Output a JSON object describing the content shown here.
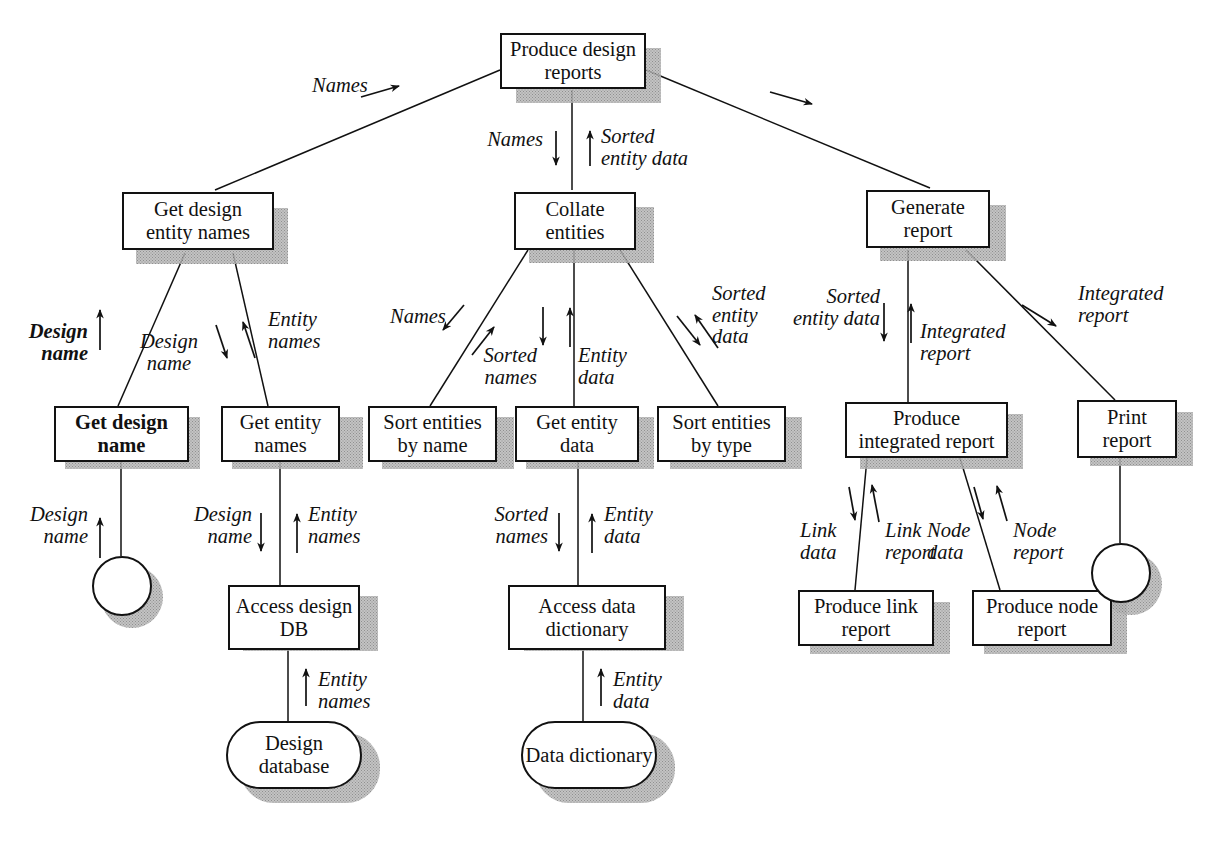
{
  "diagram": {
    "type": "structure-chart",
    "ink_color": "#121212",
    "background_color": "#ffffff",
    "shadow_color": "#b9b9b9"
  },
  "nodes": {
    "root": {
      "label": "Produce\ndesign reports",
      "shape": "box",
      "bold_text": false
    },
    "get_design_names": {
      "label": "Get design\nentity names",
      "shape": "box",
      "bold_text": false
    },
    "collate": {
      "label": "Collate\nentities",
      "shape": "box",
      "bold_text": false
    },
    "generate": {
      "label": "Generate\nreport",
      "shape": "box",
      "bold_text": false
    },
    "get_design_name": {
      "label": "Get design\nname",
      "shape": "box",
      "bold_text": true
    },
    "get_entity_names": {
      "label": "Get entity\nnames",
      "shape": "box",
      "bold_text": false
    },
    "sort_by_name": {
      "label": "Sort entities\nby name",
      "shape": "box",
      "bold_text": false
    },
    "get_entity_data": {
      "label": "Get entity\ndata",
      "shape": "box",
      "bold_text": false
    },
    "sort_by_type": {
      "label": "Sort entities\nby type",
      "shape": "box",
      "bold_text": false
    },
    "produce_integrated": {
      "label": "Produce\nintegrated report",
      "shape": "box",
      "bold_text": false
    },
    "print_report": {
      "label": "Print\nreport",
      "shape": "box",
      "bold_text": false
    },
    "access_design_db": {
      "label": "Access\ndesign DB",
      "shape": "box",
      "bold_text": false
    },
    "access_data_dict": {
      "label": "Access\ndata dictionary",
      "shape": "box",
      "bold_text": false
    },
    "produce_link": {
      "label": "Produce link\nreport",
      "shape": "box",
      "bold_text": false
    },
    "produce_node": {
      "label": "Produce\nnode report",
      "shape": "box",
      "bold_text": false
    },
    "design_database": {
      "label": "Design\ndatabase",
      "shape": "datastore",
      "bold_text": false
    },
    "data_dictionary": {
      "label": "Data\ndictionary",
      "shape": "datastore",
      "bold_text": false
    },
    "terminator_left": {
      "label": "",
      "shape": "circle",
      "bold_text": false
    },
    "terminator_right": {
      "label": "",
      "shape": "circle",
      "bold_text": false
    }
  },
  "flows": [
    {
      "id": "f01",
      "label": "Names",
      "direction": "up",
      "bold": false,
      "from": "get_design_names",
      "to": "root"
    },
    {
      "id": "f02",
      "label": "Names",
      "direction": "down",
      "bold": false,
      "from": "root",
      "to": "collate"
    },
    {
      "id": "f03",
      "label": "Sorted\nentity data",
      "direction": "up",
      "bold": false,
      "from": "collate",
      "to": "root"
    },
    {
      "id": "f04",
      "label": "",
      "direction": "down",
      "bold": false,
      "from": "root",
      "to": "generate"
    },
    {
      "id": "f05",
      "label": "Design\nname",
      "direction": "up",
      "bold": true,
      "from": "get_design_name",
      "to": "get_design_names"
    },
    {
      "id": "f06",
      "label": "Design\nname",
      "direction": "down",
      "bold": false,
      "from": "get_design_names",
      "to": "get_entity_names"
    },
    {
      "id": "f07",
      "label": "Entity\nnames",
      "direction": "up",
      "bold": false,
      "from": "get_entity_names",
      "to": "get_design_names"
    },
    {
      "id": "f08",
      "label": "Names",
      "direction": "down",
      "bold": false,
      "from": "collate",
      "to": "sort_by_name"
    },
    {
      "id": "f09",
      "label": "Sorted\nnames",
      "direction": "up",
      "bold": false,
      "from": "sort_by_name",
      "to": "collate"
    },
    {
      "id": "f10",
      "label": "Entity\ndata",
      "direction": "up",
      "bold": false,
      "from": "get_entity_data",
      "to": "collate"
    },
    {
      "id": "f11",
      "label": "Sorted\nentity\ndata",
      "direction": "both",
      "bold": false,
      "from": "collate",
      "to": "sort_by_type"
    },
    {
      "id": "f12",
      "label": "Sorted\nentity data",
      "direction": "down",
      "bold": false,
      "from": "generate",
      "to": "produce_integrated"
    },
    {
      "id": "f13",
      "label": "Integrated\nreport",
      "direction": "up",
      "bold": false,
      "from": "produce_integrated",
      "to": "generate"
    },
    {
      "id": "f14",
      "label": "Integrated\nreport",
      "direction": "down",
      "bold": false,
      "from": "generate",
      "to": "print_report"
    },
    {
      "id": "f15",
      "label": "Design\nname",
      "direction": "up",
      "bold": false,
      "from": "terminator_left",
      "to": "get_design_name"
    },
    {
      "id": "f16",
      "label": "Design\nname",
      "direction": "down",
      "bold": false,
      "from": "get_entity_names",
      "to": "access_design_db"
    },
    {
      "id": "f17",
      "label": "Entity\nnames",
      "direction": "up",
      "bold": false,
      "from": "access_design_db",
      "to": "get_entity_names"
    },
    {
      "id": "f18",
      "label": "Sorted\nnames",
      "direction": "down",
      "bold": false,
      "from": "get_entity_data",
      "to": "access_data_dict"
    },
    {
      "id": "f19",
      "label": "Entity\ndata",
      "direction": "up",
      "bold": false,
      "from": "access_data_dict",
      "to": "get_entity_data"
    },
    {
      "id": "f20",
      "label": "Link\ndata",
      "direction": "down",
      "bold": false,
      "from": "produce_integrated",
      "to": "produce_link"
    },
    {
      "id": "f21",
      "label": "Link\nreport",
      "direction": "up",
      "bold": false,
      "from": "produce_link",
      "to": "produce_integrated"
    },
    {
      "id": "f22",
      "label": "Node\ndata",
      "direction": "down",
      "bold": false,
      "from": "produce_integrated",
      "to": "produce_node"
    },
    {
      "id": "f23",
      "label": "Node\nreport",
      "direction": "up",
      "bold": false,
      "from": "produce_node",
      "to": "produce_integrated"
    },
    {
      "id": "f24",
      "label": "Entity\nnames",
      "direction": "up",
      "bold": false,
      "from": "design_database",
      "to": "access_design_db"
    },
    {
      "id": "f25",
      "label": "Entity\ndata",
      "direction": "up",
      "bold": false,
      "from": "data_dictionary",
      "to": "access_data_dict"
    }
  ]
}
